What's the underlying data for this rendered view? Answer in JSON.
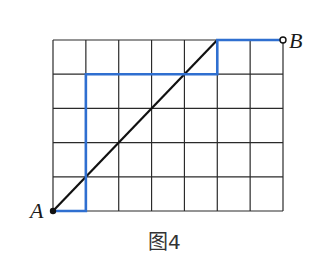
{
  "figure": {
    "caption": "图4",
    "grid": {
      "columns": 7,
      "rows": 5,
      "left": 53,
      "top": 40,
      "right": 283,
      "bottom": 211,
      "line_color": "#2a2a2a"
    },
    "points": {
      "A": {
        "label": "A",
        "col": 0,
        "row": 5
      },
      "B": {
        "label": "B",
        "col": 7,
        "row": 0
      }
    },
    "diagonal_path": {
      "from": "A",
      "to": [
        5,
        0
      ],
      "color": "#111111"
    },
    "blue_path": {
      "color": "#2f6fd0",
      "vertices": [
        [
          0,
          5
        ],
        [
          1,
          5
        ],
        [
          1,
          1
        ],
        [
          5,
          1
        ],
        [
          5,
          0
        ],
        [
          7,
          0
        ]
      ]
    }
  }
}
